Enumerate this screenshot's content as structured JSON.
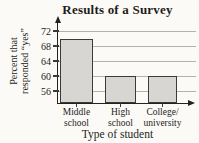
{
  "chart_data": {
    "type": "bar",
    "title": "Results of a Survey",
    "categories": [
      "Middle school",
      "High school",
      "College/university"
    ],
    "values": [
      70,
      60,
      60
    ],
    "category_label_lines": [
      [
        "Middle",
        "school"
      ],
      [
        "High",
        "school"
      ],
      [
        "College/",
        "university"
      ]
    ],
    "xlabel": "Type of student",
    "ylabel": "Percent that responded “yes”",
    "ylabel_lines": [
      "Percent that",
      "responded “yes”"
    ],
    "yticks": [
      56,
      60,
      64,
      68,
      72
    ],
    "ylim": [
      52.8,
      75.2
    ],
    "grid": true,
    "legend_position": "none",
    "colors": {
      "bar_fill": "#d7d6d2",
      "bar_border": "#3c3b38",
      "grid": "#b3b2ae",
      "axis": "#23221f",
      "text": "#1e1d1a",
      "background": "#fbfaf7"
    }
  }
}
